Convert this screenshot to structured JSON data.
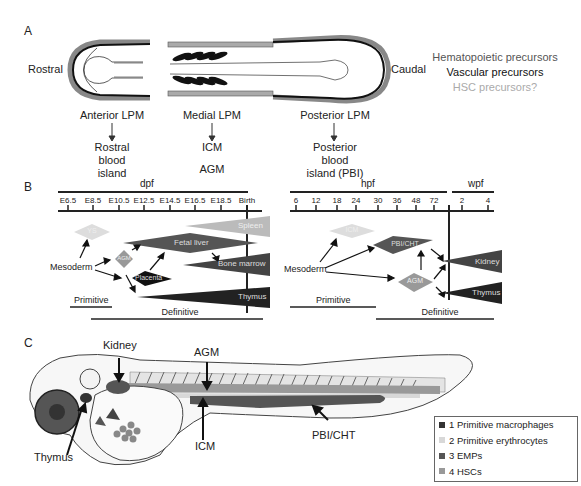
{
  "panel_a": {
    "label": "A",
    "rostral": "Rostral",
    "caudal": "Caudal",
    "anterior_lpm": "Anterior LPM",
    "anterior_fate": [
      "Rostral",
      "blood",
      "island"
    ],
    "medial_lpm": "Medial LPM",
    "medial_fate_1": "ICM",
    "medial_fate_2": "AGM",
    "posterior_lpm": "Posterior LPM",
    "posterior_fate": [
      "Posterior",
      "blood",
      "island (PBI)"
    ],
    "key": [
      {
        "label": "Hematopoietic precursors",
        "color": "#555555"
      },
      {
        "label": "Vascular precursors",
        "color": "#111111"
      },
      {
        "label": "HSC precursors?",
        "color": "#aaaaaa"
      }
    ]
  },
  "panel_b": {
    "label": "B",
    "mouse": {
      "axis_title": "dpf",
      "ticks": [
        "E6.5",
        "E8.5",
        "E10.5",
        "E12.5",
        "E14.5",
        "E16.5",
        "E18.5",
        "Birth"
      ],
      "nodes": {
        "ys": "YS",
        "agm": "AGM",
        "placenta": "Placenta",
        "fetal_liver": "Fetal liver",
        "spleen": "Spleen",
        "bone_marrow": "Bone marrow",
        "thymus": "Thymus"
      },
      "source": "Mesoderm",
      "primitive": "Primitive",
      "definitive": "Definitive"
    },
    "zebrafish": {
      "axis_title_hpf": "hpf",
      "ticks_hpf": [
        "6",
        "12",
        "18",
        "24",
        "30",
        "36",
        "48",
        "72"
      ],
      "axis_title_wpf": "wpf",
      "ticks_wpf": [
        "2",
        "4"
      ],
      "nodes": {
        "icm": "ICM",
        "pbi": "PBI/CHT",
        "agm": "AGM",
        "kidney": "Kidney",
        "thymus": "Thymus"
      },
      "source": "Mesoderm",
      "primitive": "Primitive",
      "definitive": "Definitive"
    }
  },
  "panel_c": {
    "label": "C",
    "labels": {
      "kidney": "Kidney",
      "agm": "AGM",
      "icm": "ICM",
      "thymus": "Thymus",
      "pbi": "PBI/CHT"
    },
    "legend": [
      {
        "label": "1 Primitive macrophages",
        "color": "#333333"
      },
      {
        "label": "2 Primitive erythrocytes",
        "color": "#d8d8d8"
      },
      {
        "label": "3 EMPs",
        "color": "#555555"
      },
      {
        "label": "4 HSCs",
        "color": "#999999"
      }
    ]
  }
}
